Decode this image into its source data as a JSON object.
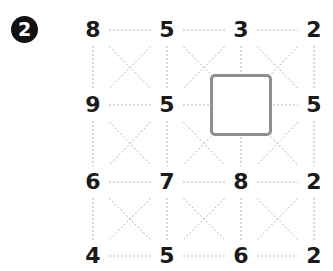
{
  "puzzle": {
    "number_badge": "2",
    "grid": [
      [
        "8",
        "5",
        "3",
        "2"
      ],
      [
        "9",
        "5",
        "",
        "5"
      ],
      [
        "6",
        "7",
        "8",
        "2"
      ],
      [
        "4",
        "5",
        "6",
        "2"
      ]
    ],
    "blank_cell": {
      "row": 1,
      "col": 2
    },
    "line_color": "#b5b5b5",
    "number_color": "#1a1a1a",
    "box_color": "#8f8f8f"
  }
}
